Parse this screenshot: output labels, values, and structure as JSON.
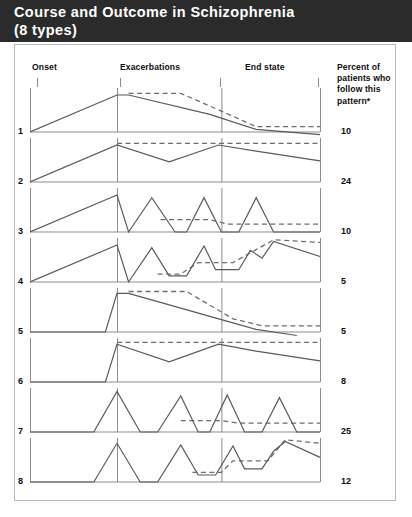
{
  "title": {
    "line1": "Course and Outcome in Schizophrenia",
    "line2": "(8 types)"
  },
  "colors": {
    "title_bar": "#2b2b2b",
    "title_text": "#ffffff",
    "plot_line": "#5a5a5a",
    "dashed_line": "#6e6e6e",
    "axis": "#8d8d8d",
    "frame": "#b9b9b9",
    "text": "#0d0d0d"
  },
  "columns": {
    "onset": "Onset",
    "exacerbations": "Exacerbations",
    "end_state": "End state",
    "percent": "Percent of patients who follow this pattern*"
  },
  "chart_data": {
    "type": "line",
    "title": "Course and Outcome in Schizophrenia (8 types)",
    "xlabel": "",
    "ylabel": "",
    "grid": false,
    "legend_position": "none",
    "axis_markers": [
      "Onset",
      "Exacerbations",
      "End state"
    ],
    "series_styles": {
      "solid": "symptom severity course",
      "dashed": "level of residual impairment / outcome"
    },
    "categories": [
      "1",
      "2",
      "3",
      "4",
      "5",
      "6",
      "7",
      "8"
    ],
    "values": [
      10,
      24,
      10,
      5,
      5,
      8,
      25,
      12
    ],
    "value_label": "Percent of patients who follow this pattern*",
    "total_percent": 99,
    "patterns": [
      {
        "id": "1",
        "percent": 10,
        "onset": "insidious",
        "course": "single episode, gradual recovery",
        "end_state": "full remission",
        "solid": [
          [
            0,
            0
          ],
          [
            30,
            84
          ],
          [
            34,
            84
          ],
          [
            62,
            40
          ],
          [
            78,
            6
          ],
          [
            100,
            -6
          ]
        ],
        "dashed": [
          [
            34,
            88
          ],
          [
            52,
            88
          ],
          [
            70,
            36
          ],
          [
            78,
            12
          ],
          [
            100,
            12
          ]
        ]
      },
      {
        "id": "2",
        "percent": 24,
        "onset": "insidious",
        "course": "episodic with partial remission",
        "end_state": "mild residual impairment",
        "solid": [
          [
            0,
            0
          ],
          [
            30,
            84
          ],
          [
            48,
            46
          ],
          [
            65,
            84
          ],
          [
            78,
            70
          ],
          [
            100,
            48
          ]
        ],
        "dashed": [
          [
            30,
            88
          ],
          [
            100,
            88
          ]
        ]
      },
      {
        "id": "3",
        "percent": 10,
        "onset": "insidious",
        "course": "repeated exacerbations, return to baseline",
        "end_state": "full remission between episodes",
        "solid": [
          [
            0,
            0
          ],
          [
            30,
            84
          ],
          [
            34,
            0
          ],
          [
            42,
            78
          ],
          [
            50,
            0
          ],
          [
            54,
            0
          ],
          [
            60,
            78
          ],
          [
            66,
            0
          ],
          [
            72,
            0
          ],
          [
            78,
            78
          ],
          [
            84,
            0
          ],
          [
            100,
            0
          ]
        ],
        "dashed": [
          [
            45,
            28
          ],
          [
            62,
            28
          ],
          [
            68,
            18
          ],
          [
            100,
            18
          ]
        ]
      },
      {
        "id": "4",
        "percent": 5,
        "onset": "insidious",
        "course": "exacerbations with increasing residual deficit",
        "end_state": "moderate stable impairment",
        "solid": [
          [
            0,
            0
          ],
          [
            30,
            84
          ],
          [
            34,
            0
          ],
          [
            42,
            78
          ],
          [
            48,
            14
          ],
          [
            54,
            14
          ],
          [
            60,
            82
          ],
          [
            64,
            28
          ],
          [
            72,
            28
          ],
          [
            76,
            72
          ],
          [
            80,
            54
          ],
          [
            84,
            92
          ],
          [
            100,
            58
          ]
        ],
        "dashed": [
          [
            44,
            18
          ],
          [
            52,
            18
          ],
          [
            58,
            44
          ],
          [
            70,
            44
          ],
          [
            84,
            96
          ],
          [
            100,
            90
          ]
        ]
      },
      {
        "id": "5",
        "percent": 5,
        "onset": "acute",
        "course": "single episode, gradual recovery",
        "end_state": "full remission",
        "solid": [
          [
            0,
            0
          ],
          [
            26,
            0
          ],
          [
            30,
            88
          ],
          [
            34,
            88
          ],
          [
            66,
            28
          ],
          [
            78,
            6
          ],
          [
            92,
            -8
          ]
        ],
        "dashed": [
          [
            34,
            92
          ],
          [
            54,
            92
          ],
          [
            70,
            30
          ],
          [
            80,
            14
          ],
          [
            100,
            14
          ]
        ]
      },
      {
        "id": "6",
        "percent": 8,
        "onset": "acute",
        "course": "episodic with partial remission",
        "end_state": "mild residual impairment",
        "solid": [
          [
            0,
            0
          ],
          [
            26,
            0
          ],
          [
            30,
            86
          ],
          [
            48,
            46
          ],
          [
            65,
            86
          ],
          [
            78,
            70
          ],
          [
            100,
            48
          ]
        ],
        "dashed": [
          [
            30,
            90
          ],
          [
            100,
            90
          ]
        ]
      },
      {
        "id": "7",
        "percent": 25,
        "onset": "acute",
        "course": "repeated exacerbations, return to baseline",
        "end_state": "full remission between episodes",
        "solid": [
          [
            0,
            0
          ],
          [
            22,
            0
          ],
          [
            30,
            92
          ],
          [
            38,
            0
          ],
          [
            44,
            0
          ],
          [
            52,
            82
          ],
          [
            58,
            0
          ],
          [
            62,
            0
          ],
          [
            68,
            84
          ],
          [
            74,
            0
          ],
          [
            80,
            0
          ],
          [
            86,
            78
          ],
          [
            92,
            0
          ],
          [
            100,
            0
          ]
        ],
        "dashed": [
          [
            52,
            26
          ],
          [
            66,
            26
          ],
          [
            72,
            20
          ],
          [
            100,
            20
          ]
        ]
      },
      {
        "id": "8",
        "percent": 12,
        "onset": "acute",
        "course": "exacerbations with increasing residual deficit",
        "end_state": "moderate stable impairment",
        "solid": [
          [
            0,
            0
          ],
          [
            22,
            0
          ],
          [
            30,
            88
          ],
          [
            38,
            0
          ],
          [
            44,
            0
          ],
          [
            52,
            84
          ],
          [
            58,
            16
          ],
          [
            64,
            16
          ],
          [
            70,
            82
          ],
          [
            74,
            30
          ],
          [
            80,
            30
          ],
          [
            84,
            70
          ],
          [
            88,
            92
          ],
          [
            100,
            56
          ]
        ],
        "dashed": [
          [
            56,
            22
          ],
          [
            66,
            22
          ],
          [
            70,
            48
          ],
          [
            82,
            48
          ],
          [
            88,
            96
          ],
          [
            100,
            88
          ]
        ]
      }
    ]
  },
  "layout": {
    "panel_ticks_x": [
      37,
      120,
      220,
      318
    ],
    "panel_axis_x_pct": [
      0,
      30,
      66,
      100
    ]
  }
}
